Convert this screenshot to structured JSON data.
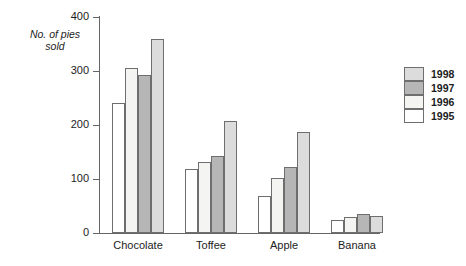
{
  "chart_data": {
    "type": "bar",
    "title": "",
    "subtitle": "",
    "xlabel": "",
    "ylabel": "No. of pies\nsold",
    "ylim": [
      0,
      400
    ],
    "yticks": [
      0,
      100,
      200,
      300,
      400
    ],
    "ytick_labels": [
      "0",
      "100",
      "200",
      "300",
      "400"
    ],
    "grid": false,
    "legend_position": "right",
    "categories": [
      "Chocolate",
      "Toffee",
      "Apple",
      "Banana"
    ],
    "series": [
      {
        "name": "1995",
        "color": "#ffffff",
        "values": [
          240,
          118,
          68,
          25
        ]
      },
      {
        "name": "1996",
        "color": "#f4f4f2",
        "values": [
          305,
          132,
          102,
          30
        ]
      },
      {
        "name": "1997",
        "color": "#b6b6b6",
        "values": [
          293,
          142,
          122,
          35
        ]
      },
      {
        "name": "1998",
        "color": "#dcdcdc",
        "values": [
          360,
          208,
          187,
          31
        ]
      }
    ],
    "series_draw_order": [
      "1995",
      "1996",
      "1997",
      "1998"
    ],
    "legend_entries": [
      {
        "label": "1998",
        "color": "#dcdcdc"
      },
      {
        "label": "1997",
        "color": "#b6b6b6"
      },
      {
        "label": "1996",
        "color": "#f4f4f2"
      },
      {
        "label": "1995",
        "color": "#ffffff"
      }
    ],
    "axis_color": "#666666",
    "bar_outline_color": "#6e6e6e",
    "background_color": "#ffffff"
  }
}
